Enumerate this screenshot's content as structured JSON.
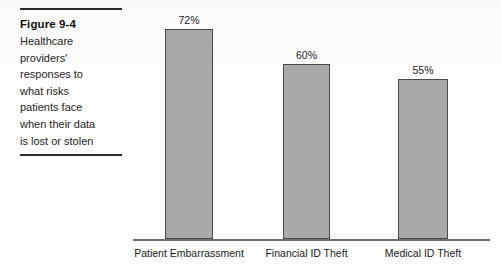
{
  "figure": {
    "title": "Figure 9-4",
    "caption_lines": [
      "Healthcare",
      "providers'",
      "responses to",
      "what risks",
      "patients face",
      "when their data",
      "is lost or stolen"
    ]
  },
  "chart_data": {
    "type": "bar",
    "title": "",
    "subtitle": "",
    "xlabel": "",
    "ylabel": "",
    "categories": [
      "Patient Embarrassment",
      "Financial ID Theft",
      "Medical ID Theft"
    ],
    "values": [
      72,
      60,
      55
    ],
    "value_labels": [
      "72%",
      "60%",
      "55%"
    ],
    "ylim": [
      0,
      82
    ],
    "grid": false,
    "legend": null,
    "bar_color": "#a9a9a9",
    "bar_border_color": "#4a4a4a",
    "axis_color": "#6f6f6f"
  }
}
